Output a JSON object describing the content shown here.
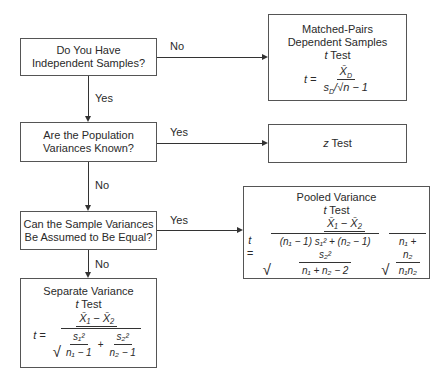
{
  "questions": [
    {
      "id": "q1",
      "line1": "Do You Have",
      "line2": "Independent Samples?"
    },
    {
      "id": "q2",
      "line1": "Are the Population",
      "line2": "Variances Known?"
    },
    {
      "id": "q3",
      "line1": "Can the Sample Variances",
      "line2": "Be Assumed to Be Equal?"
    }
  ],
  "edges": {
    "q1_no": "No",
    "q1_yes": "Yes",
    "q2_yes": "Yes",
    "q2_no": "No",
    "q3_yes": "Yes",
    "q3_no": "No"
  },
  "results": {
    "matched": {
      "title1": "Matched-Pairs",
      "title2": "Dependent Samples",
      "title3_var": "t",
      "title3_rest": " Test",
      "formula_lhs": "t =",
      "numerator": "X̄",
      "numerator_sub": "D",
      "denominator": "s",
      "denominator_sub": "D",
      "denominator_rest": "/√n − 1"
    },
    "ztest": {
      "var": "z",
      "rest": " Test"
    },
    "pooled": {
      "title1": "Pooled Variance",
      "title2_var": "t",
      "title2_rest": " Test",
      "formula_lhs": "t =",
      "numerator": "X̄₁ − X̄₂",
      "inner_num": "(n₁ − 1) s₁² + (n₂ − 1) s₂²",
      "inner_den": "n₁ + n₂ − 2",
      "right_num": "n₁ + n₂",
      "right_den": "n₁n₂"
    },
    "separate": {
      "title1": "Separate Variance",
      "title2_var": "t",
      "title2_rest": " Test",
      "formula_lhs": "t =",
      "numerator": "X̄₁ − X̄₂",
      "term1_num": "s₁²",
      "term1_den": "n₁ − 1",
      "plus": "+",
      "term2_num": "s₂²",
      "term2_den": "n₂ − 1"
    }
  }
}
